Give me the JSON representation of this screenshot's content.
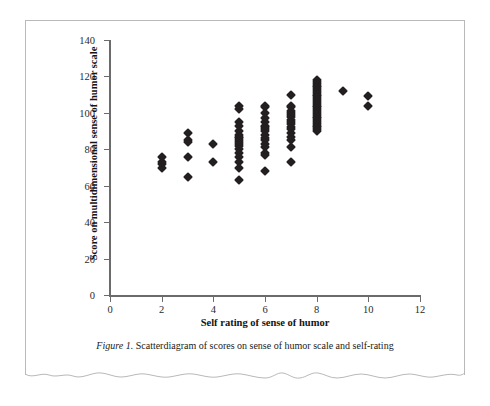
{
  "figure": {
    "caption_figure_number": "Figure 1.",
    "caption_text": " Scatterdiagram of scores on sense of humor scale and self-rating"
  },
  "chart_data": {
    "type": "scatter",
    "title": "",
    "xlabel": "Self rating of sense of humor",
    "ylabel": "Score on multidimensional sense of humor scale",
    "xlim": [
      0,
      12
    ],
    "ylim": [
      0,
      140
    ],
    "xticks": [
      0,
      2,
      4,
      6,
      8,
      10,
      12
    ],
    "yticks": [
      0,
      20,
      40,
      60,
      80,
      100,
      120,
      140
    ],
    "grid": false,
    "legend": false,
    "marker": "diamond",
    "marker_color": "#231f20",
    "points": [
      {
        "x": 2,
        "y": 76
      },
      {
        "x": 2,
        "y": 73
      },
      {
        "x": 2,
        "y": 72
      },
      {
        "x": 2,
        "y": 70
      },
      {
        "x": 3,
        "y": 89
      },
      {
        "x": 3,
        "y": 85
      },
      {
        "x": 3,
        "y": 84
      },
      {
        "x": 3,
        "y": 76
      },
      {
        "x": 3,
        "y": 65
      },
      {
        "x": 4,
        "y": 83
      },
      {
        "x": 4,
        "y": 73
      },
      {
        "x": 5,
        "y": 104
      },
      {
        "x": 5,
        "y": 102
      },
      {
        "x": 5,
        "y": 95
      },
      {
        "x": 5,
        "y": 93
      },
      {
        "x": 5,
        "y": 90
      },
      {
        "x": 5,
        "y": 88
      },
      {
        "x": 5,
        "y": 87
      },
      {
        "x": 5,
        "y": 86
      },
      {
        "x": 5,
        "y": 85
      },
      {
        "x": 5,
        "y": 84
      },
      {
        "x": 5,
        "y": 83
      },
      {
        "x": 5,
        "y": 82
      },
      {
        "x": 5,
        "y": 80
      },
      {
        "x": 5,
        "y": 78
      },
      {
        "x": 5,
        "y": 76
      },
      {
        "x": 5,
        "y": 73
      },
      {
        "x": 5,
        "y": 70
      },
      {
        "x": 5,
        "y": 63
      },
      {
        "x": 6,
        "y": 104
      },
      {
        "x": 6,
        "y": 103
      },
      {
        "x": 6,
        "y": 100
      },
      {
        "x": 6,
        "y": 97
      },
      {
        "x": 6,
        "y": 95
      },
      {
        "x": 6,
        "y": 93
      },
      {
        "x": 6,
        "y": 92
      },
      {
        "x": 6,
        "y": 91
      },
      {
        "x": 6,
        "y": 90
      },
      {
        "x": 6,
        "y": 88
      },
      {
        "x": 6,
        "y": 86
      },
      {
        "x": 6,
        "y": 85
      },
      {
        "x": 6,
        "y": 83
      },
      {
        "x": 6,
        "y": 81
      },
      {
        "x": 6,
        "y": 78
      },
      {
        "x": 6,
        "y": 77
      },
      {
        "x": 6,
        "y": 68
      },
      {
        "x": 7,
        "y": 110
      },
      {
        "x": 7,
        "y": 104
      },
      {
        "x": 7,
        "y": 103
      },
      {
        "x": 7,
        "y": 101
      },
      {
        "x": 7,
        "y": 100
      },
      {
        "x": 7,
        "y": 99
      },
      {
        "x": 7,
        "y": 98
      },
      {
        "x": 7,
        "y": 96
      },
      {
        "x": 7,
        "y": 95
      },
      {
        "x": 7,
        "y": 94
      },
      {
        "x": 7,
        "y": 92
      },
      {
        "x": 7,
        "y": 91
      },
      {
        "x": 7,
        "y": 89
      },
      {
        "x": 7,
        "y": 87
      },
      {
        "x": 7,
        "y": 85
      },
      {
        "x": 7,
        "y": 81
      },
      {
        "x": 7,
        "y": 73
      },
      {
        "x": 8,
        "y": 118
      },
      {
        "x": 8,
        "y": 117
      },
      {
        "x": 8,
        "y": 116
      },
      {
        "x": 8,
        "y": 115
      },
      {
        "x": 8,
        "y": 114
      },
      {
        "x": 8,
        "y": 113
      },
      {
        "x": 8,
        "y": 112
      },
      {
        "x": 8,
        "y": 111
      },
      {
        "x": 8,
        "y": 110
      },
      {
        "x": 8,
        "y": 109
      },
      {
        "x": 8,
        "y": 108
      },
      {
        "x": 8,
        "y": 107
      },
      {
        "x": 8,
        "y": 106
      },
      {
        "x": 8,
        "y": 105
      },
      {
        "x": 8,
        "y": 104
      },
      {
        "x": 8,
        "y": 103
      },
      {
        "x": 8,
        "y": 102
      },
      {
        "x": 8,
        "y": 101
      },
      {
        "x": 8,
        "y": 100
      },
      {
        "x": 8,
        "y": 99
      },
      {
        "x": 8,
        "y": 98
      },
      {
        "x": 8,
        "y": 97
      },
      {
        "x": 8,
        "y": 96
      },
      {
        "x": 8,
        "y": 95
      },
      {
        "x": 8,
        "y": 94
      },
      {
        "x": 8,
        "y": 93
      },
      {
        "x": 8,
        "y": 92
      },
      {
        "x": 8,
        "y": 91
      },
      {
        "x": 8,
        "y": 90
      },
      {
        "x": 9,
        "y": 112
      },
      {
        "x": 10,
        "y": 109
      },
      {
        "x": 10,
        "y": 104
      }
    ]
  }
}
